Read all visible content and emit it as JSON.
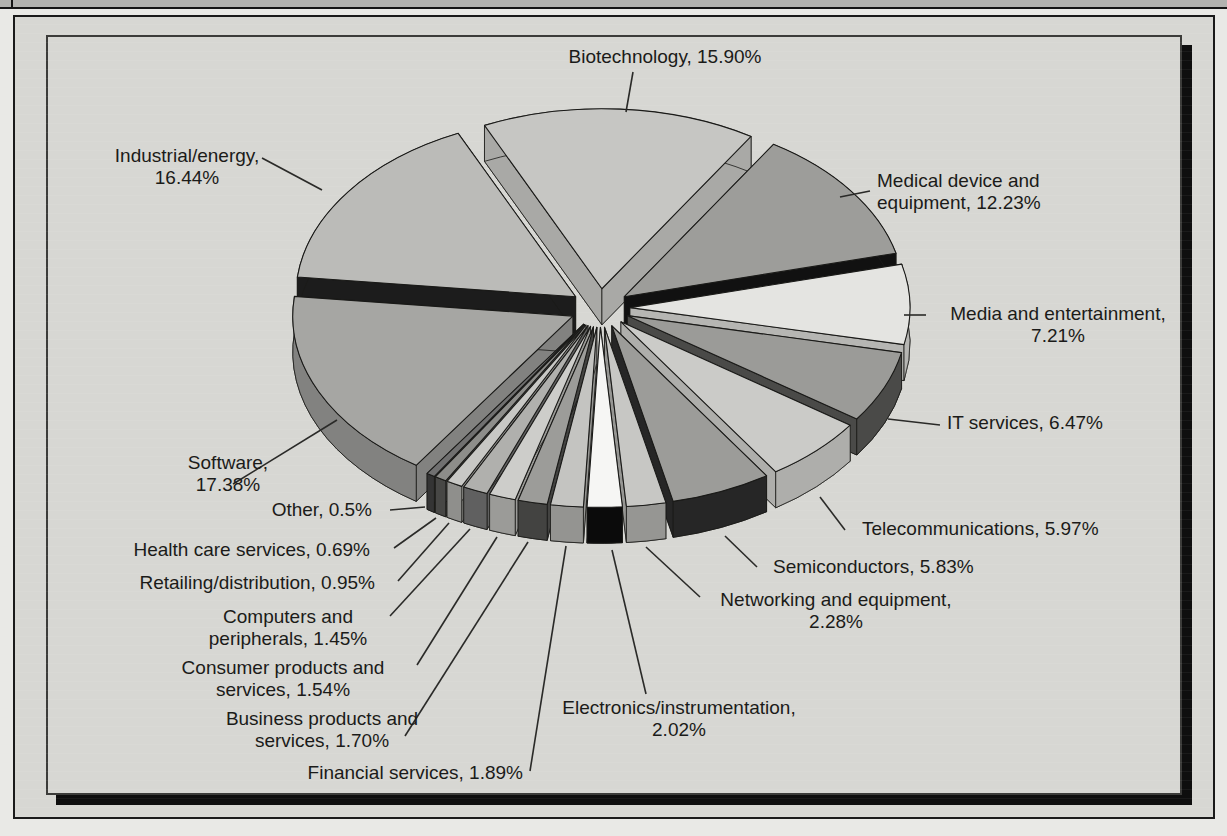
{
  "figure": {
    "kind": "scanned textbook figure",
    "colors": {
      "page_bg": "#e9e9e6",
      "panel_bg": "#d7d7d3",
      "strip_bg": "#b3b3b0",
      "frame_shadow": "#0e0e0e",
      "ink": "#1b1b19",
      "pointer_line": "#2a2a28"
    }
  },
  "chart_data": {
    "type": "pie",
    "style": "3d-exploded-grayscale",
    "unit": "%",
    "legend_position": "callout-labels",
    "slices": [
      {
        "key": "biotechnology",
        "label": "Biotechnology",
        "value": 15.9,
        "top": "#c6c6c3",
        "side": "#a9a9a6",
        "callout": {
          "align": "center",
          "x": 665,
          "y": 46,
          "lines": [
            "Biotechnology, 15.90%"
          ]
        },
        "pointer": [
          [
            633,
            72
          ],
          [
            626,
            112
          ]
        ]
      },
      {
        "key": "medical-device",
        "label": "Medical device and equipment",
        "value": 12.23,
        "top": "#9d9d9a",
        "side": "#111111",
        "callout": {
          "align": "left",
          "x": 877,
          "y": 170,
          "lines": [
            "Medical device and",
            "equipment, 12.23%"
          ]
        },
        "pointer": [
          [
            870,
            191
          ],
          [
            840,
            197
          ]
        ]
      },
      {
        "key": "media-entertainment",
        "label": "Media and entertainment",
        "value": 7.21,
        "top": "#e4e4e1",
        "side": "#b6b6b3",
        "callout": {
          "align": "center",
          "x": 1058,
          "y": 303,
          "lines": [
            "Media and entertainment,",
            "7.21%"
          ]
        },
        "pointer": [
          [
            926,
            315
          ],
          [
            904,
            315
          ]
        ]
      },
      {
        "key": "it-services",
        "label": "IT services",
        "value": 6.47,
        "top": "#9b9b98",
        "side": "#4a4a48",
        "callout": {
          "align": "left",
          "x": 947,
          "y": 412,
          "lines": [
            "IT services, 6.47%"
          ]
        },
        "pointer": [
          [
            940,
            425
          ],
          [
            888,
            419
          ]
        ]
      },
      {
        "key": "telecommunications",
        "label": "Telecommunications",
        "value": 5.97,
        "top": "#cbcbc8",
        "side": "#aeaeab",
        "callout": {
          "align": "left",
          "x": 862,
          "y": 518,
          "lines": [
            "Telecommunications, 5.97%"
          ]
        },
        "pointer": [
          [
            845,
            530
          ],
          [
            820,
            497
          ]
        ]
      },
      {
        "key": "semiconductors",
        "label": "Semiconductors",
        "value": 5.83,
        "top": "#9c9c99",
        "side": "#262626",
        "callout": {
          "align": "left",
          "x": 773,
          "y": 556,
          "lines": [
            "Semiconductors, 5.83%"
          ]
        },
        "pointer": [
          [
            757,
            567
          ],
          [
            725,
            536
          ]
        ]
      },
      {
        "key": "networking",
        "label": "Networking and equipment",
        "value": 2.28,
        "top": "#c7c7c4",
        "side": "#969693",
        "callout": {
          "align": "center",
          "x": 836,
          "y": 589,
          "lines": [
            "Networking and equipment,",
            "2.28%"
          ]
        },
        "pointer": [
          [
            700,
            597
          ],
          [
            646,
            547
          ]
        ]
      },
      {
        "key": "electronics",
        "label": "Electronics/instrumentation",
        "value": 2.02,
        "top": "#f6f6f4",
        "side": "#0b0b0b",
        "callout": {
          "align": "center",
          "x": 679,
          "y": 697,
          "lines": [
            "Electronics/instrumentation,",
            "2.02%"
          ]
        },
        "pointer": [
          [
            646,
            694
          ],
          [
            612,
            550
          ]
        ]
      },
      {
        "key": "financial-services",
        "label": "Financial services",
        "value": 1.89,
        "top": "#c4c4c1",
        "side": "#949491",
        "callout": {
          "align": "right",
          "x": 523,
          "y": 762,
          "lines": [
            "Financial services, 1.89%"
          ]
        },
        "pointer": [
          [
            530,
            771
          ],
          [
            566,
            546
          ]
        ]
      },
      {
        "key": "business-products",
        "label": "Business products and services",
        "value": 1.7,
        "top": "#9c9c99",
        "side": "#434341",
        "callout": {
          "align": "center",
          "x": 322,
          "y": 708,
          "lines": [
            "Business products and",
            "services, 1.70%"
          ]
        },
        "pointer": [
          [
            405,
            736
          ],
          [
            528,
            542
          ]
        ]
      },
      {
        "key": "consumer-products",
        "label": "Consumer products and services",
        "value": 1.54,
        "top": "#cdcdca",
        "side": "#9b9b98",
        "callout": {
          "align": "center",
          "x": 283,
          "y": 657,
          "lines": [
            "Consumer products and",
            "services, 1.54%"
          ]
        },
        "pointer": [
          [
            417,
            665
          ],
          [
            497,
            537
          ]
        ]
      },
      {
        "key": "computers-peripherals",
        "label": "Computers and peripherals",
        "value": 1.45,
        "top": "#b0b0ad",
        "side": "#606060",
        "callout": {
          "align": "center",
          "x": 288,
          "y": 606,
          "lines": [
            "Computers and",
            "peripherals, 1.45%"
          ]
        },
        "pointer": [
          [
            390,
            616
          ],
          [
            470,
            529
          ]
        ]
      },
      {
        "key": "retailing-distribution",
        "label": "Retailing/distribution",
        "value": 0.95,
        "top": "#c8c8c5",
        "side": "#8f8f8c",
        "callout": {
          "align": "right",
          "x": 375,
          "y": 572,
          "lines": [
            "Retailing/distribution, 0.95%"
          ]
        },
        "pointer": [
          [
            398,
            581
          ],
          [
            449,
            523
          ]
        ]
      },
      {
        "key": "health-care",
        "label": "Health care services",
        "value": 0.69,
        "top": "#8d8d8a",
        "side": "#474745",
        "callout": {
          "align": "right",
          "x": 370,
          "y": 539,
          "lines": [
            "Health care services, 0.69%"
          ]
        },
        "pointer": [
          [
            394,
            548
          ],
          [
            436,
            518
          ]
        ]
      },
      {
        "key": "other",
        "label": "Other",
        "value": 0.5,
        "top": "#707070",
        "side": "#343434",
        "callout": {
          "align": "right",
          "x": 372,
          "y": 499,
          "lines": [
            "Other, 0.5%"
          ]
        },
        "pointer": [
          [
            390,
            510
          ],
          [
            425,
            507
          ]
        ]
      },
      {
        "key": "software",
        "label": "Software",
        "value": 17.38,
        "top": "#a6a6a3",
        "side": "#828280",
        "callout": {
          "align": "center",
          "x": 228,
          "y": 452,
          "lines": [
            "Software,",
            "17.38%"
          ]
        },
        "pointer": [
          [
            233,
            484
          ],
          [
            337,
            420
          ]
        ]
      },
      {
        "key": "industrial-energy",
        "label": "Industrial/energy",
        "value": 16.44,
        "top": "#bbbbb8",
        "side": "#1c1c1c",
        "callout": {
          "align": "center",
          "x": 187,
          "y": 145,
          "lines": [
            "Industrial/energy,",
            "16.44%"
          ]
        },
        "pointer": [
          [
            262,
            158
          ],
          [
            322,
            190
          ]
        ]
      }
    ]
  }
}
